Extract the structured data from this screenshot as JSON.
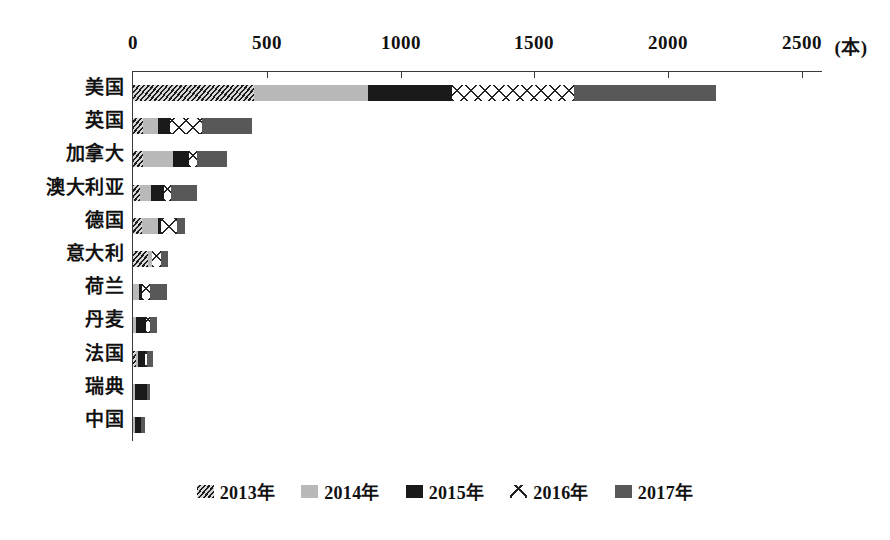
{
  "chart_data": {
    "type": "bar",
    "orientation": "horizontal",
    "stacked": true,
    "title": "",
    "xlabel": "(本)",
    "ylabel": "",
    "xlim": [
      0,
      2500
    ],
    "xticks": [
      0,
      500,
      1000,
      1500,
      2000,
      2500
    ],
    "xtick_labels": [
      "0",
      "500",
      "1000",
      "1500",
      "2000",
      "2500"
    ],
    "unit_label": "(本)",
    "grid": false,
    "legend_position": "bottom",
    "categories": [
      "美国",
      "英国",
      "加拿大",
      "澳大利亚",
      "德国",
      "意大利",
      "荷兰",
      "丹麦",
      "法国",
      "瑞典",
      "中国"
    ],
    "series": [
      {
        "name": "2013年",
        "pattern": "diagonal-hatch",
        "color": "#4a4a4a",
        "values": [
          452,
          37,
          37,
          25,
          33,
          56,
          0,
          0,
          11,
          0,
          0
        ]
      },
      {
        "name": "2014年",
        "pattern": "light-gray",
        "color": "#b9b9b9",
        "values": [
          428,
          56,
          111,
          44,
          59,
          15,
          22,
          11,
          7,
          7,
          7
        ]
      },
      {
        "name": "2015年",
        "pattern": "solid-black",
        "color": "#1a1a1a",
        "values": [
          311,
          44,
          63,
          48,
          11,
          0,
          11,
          37,
          26,
          44,
          22
        ]
      },
      {
        "name": "2016年",
        "pattern": "x-cross",
        "color": "#ffffff",
        "values": [
          456,
          122,
          30,
          26,
          63,
          33,
          30,
          15,
          7,
          0,
          0
        ]
      },
      {
        "name": "2017年",
        "pattern": "dark-gray",
        "color": "#585858",
        "values": [
          534,
          185,
          111,
          97,
          30,
          26,
          63,
          26,
          23,
          12,
          15
        ]
      }
    ],
    "totals": [
      2181,
      444,
      352,
      240,
      196,
      130,
      126,
      89,
      74,
      63,
      44
    ]
  },
  "axis": {
    "unit": "(本)",
    "ticks": [
      {
        "label": "0",
        "value": 0
      },
      {
        "label": "500",
        "value": 500
      },
      {
        "label": "1000",
        "value": 1000
      },
      {
        "label": "1500",
        "value": 1500
      },
      {
        "label": "2000",
        "value": 2000
      },
      {
        "label": "2500",
        "value": 2500
      }
    ]
  },
  "legend": {
    "items": [
      {
        "label": "2013年",
        "pattern": "diagonal-hatch"
      },
      {
        "label": "2014年",
        "pattern": "light-gray"
      },
      {
        "label": "2015年",
        "pattern": "solid-black"
      },
      {
        "label": "2016年",
        "pattern": "x-cross"
      },
      {
        "label": "2017年",
        "pattern": "dark-gray"
      }
    ]
  }
}
